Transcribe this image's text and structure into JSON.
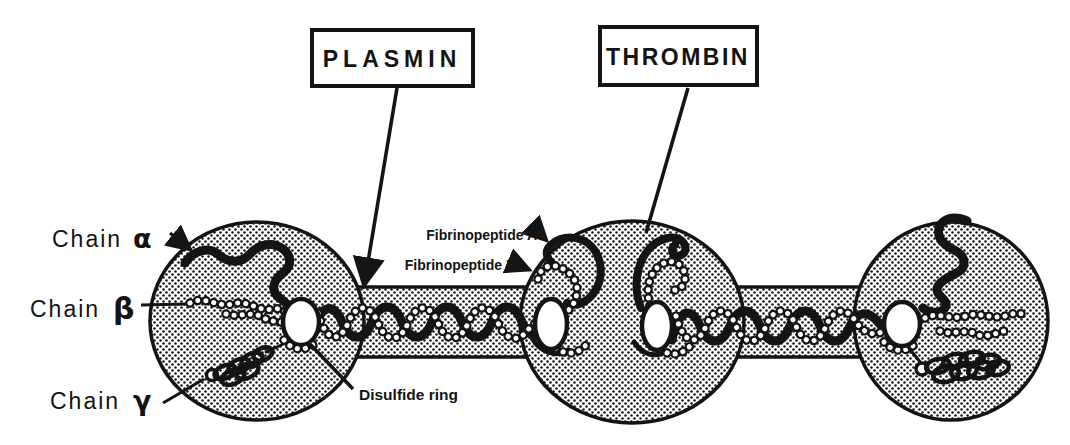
{
  "diagram": {
    "enzymes": {
      "plasmin": "PLASMIN",
      "thrombin": "THROMBIN"
    },
    "chains": {
      "alpha": {
        "word": "Chain",
        "symbol": "α"
      },
      "beta": {
        "word": "Chain",
        "symbol": "β"
      },
      "gamma": {
        "word": "Chain",
        "symbol": "γ"
      }
    },
    "annotations": {
      "fibrinopeptide_a": "Fibrinopeptide A",
      "fibrinopeptide_b": "Fibrinopeptide B",
      "disulfide_ring": "Disulfide ring"
    },
    "colors": {
      "ink": "#141414",
      "paper": "#ffffff"
    }
  }
}
